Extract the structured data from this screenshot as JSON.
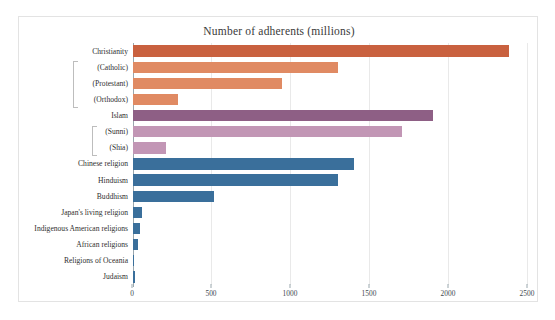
{
  "chart_data": {
    "type": "bar",
    "orientation": "horizontal",
    "title": "Number of adherents (millions)",
    "xlabel": "",
    "ylabel": "",
    "xlim": [
      0,
      2500
    ],
    "xticks": [
      0,
      500,
      1000,
      1500,
      2000,
      2500
    ],
    "xtick_labels": [
      "0",
      "500",
      "1000",
      "1500",
      "2000",
      "2500"
    ],
    "grid": true,
    "legend": "none",
    "categories": [
      "Christianity",
      "(Catholic)",
      "(Protestant)",
      "(Orthodox)",
      "Islam",
      "(Sunni)",
      "(Shia)",
      "Chinese religion",
      "Hinduism",
      "Buddhism",
      "Japan's living  religion",
      "Indigenous American religions",
      "African religions",
      "Religions of Oceania",
      "Judaism"
    ],
    "values": [
      2380,
      1300,
      940,
      285,
      1900,
      1700,
      210,
      1400,
      1300,
      510,
      60,
      45,
      33,
      4,
      15
    ],
    "bar_colors": [
      "#c9613f",
      "#e08a63",
      "#e08a63",
      "#e08a63",
      "#8e5f85",
      "#c296b5",
      "#c296b5",
      "#3a6f9b",
      "#3a6f9b",
      "#3a6f9b",
      "#3a6f9b",
      "#3a6f9b",
      "#3a6f9b",
      "#3a6f9b",
      "#3a6f9b"
    ],
    "groups": [
      {
        "parent": "Christianity",
        "children": [
          "(Catholic)",
          "(Protestant)",
          "(Orthodox)"
        ]
      },
      {
        "parent": "Islam",
        "children": [
          "(Sunni)",
          "(Shia)"
        ]
      }
    ]
  },
  "colors": {
    "christianity": "#c9613f",
    "christianity_sub": "#e08a63",
    "islam": "#8e5f85",
    "islam_sub": "#c296b5",
    "other_religions": "#3a6f9b",
    "frame": "#e3e3e3",
    "gridline": "#e9e9e9",
    "axis": "#9aa7ae",
    "text": "#2f2f2f"
  }
}
